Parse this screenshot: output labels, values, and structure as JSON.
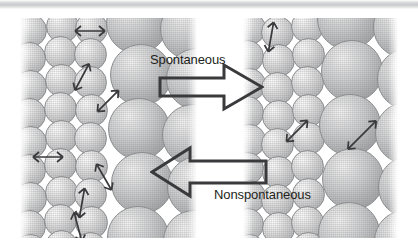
{
  "figure": {
    "title_text": "",
    "background_color": "#ffffff",
    "sphere_fill": "#d8d9da",
    "sphere_outline": "#8b8c8e",
    "arrow_color": "#3a3a3c",
    "text_color": "#231f20",
    "scan_band": true
  },
  "labels": {
    "spontaneous": "Spontaneous",
    "nonspontaneous": "Nonspontaneous"
  },
  "process_arrows": [
    {
      "name": "spontaneous-arrow",
      "direction": "right",
      "label": "Spontaneous"
    },
    {
      "name": "nonspontaneous-arrow",
      "direction": "left",
      "label": "Nonspontaneous"
    }
  ],
  "panels": {
    "left": {
      "name": "left-panel",
      "x": 20,
      "y": 18,
      "width": 177,
      "height": 220,
      "small_spheres": [
        {
          "x": -6,
          "y": -4,
          "d": 33
        },
        {
          "x": 26,
          "y": -8,
          "d": 33
        },
        {
          "x": 55,
          "y": -6,
          "d": 33
        },
        {
          "x": 24,
          "y": 18,
          "d": 33
        },
        {
          "x": -7,
          "y": 24,
          "d": 33
        },
        {
          "x": 54,
          "y": 20,
          "d": 33
        },
        {
          "x": -6,
          "y": 52,
          "d": 33
        },
        {
          "x": 25,
          "y": 46,
          "d": 33
        },
        {
          "x": 54,
          "y": 48,
          "d": 33
        },
        {
          "x": -7,
          "y": 80,
          "d": 33
        },
        {
          "x": 24,
          "y": 74,
          "d": 33
        },
        {
          "x": 55,
          "y": 76,
          "d": 33
        },
        {
          "x": -6,
          "y": 108,
          "d": 33
        },
        {
          "x": 25,
          "y": 102,
          "d": 33
        },
        {
          "x": 54,
          "y": 104,
          "d": 33
        },
        {
          "x": -7,
          "y": 136,
          "d": 33
        },
        {
          "x": 24,
          "y": 130,
          "d": 33
        },
        {
          "x": 55,
          "y": 132,
          "d": 33
        },
        {
          "x": -6,
          "y": 164,
          "d": 33
        },
        {
          "x": 25,
          "y": 158,
          "d": 33
        },
        {
          "x": 54,
          "y": 160,
          "d": 33
        },
        {
          "x": -7,
          "y": 192,
          "d": 33
        },
        {
          "x": 24,
          "y": 186,
          "d": 33
        },
        {
          "x": 55,
          "y": 188,
          "d": 33
        },
        {
          "x": 25,
          "y": 212,
          "d": 33
        },
        {
          "x": -6,
          "y": 216,
          "d": 33
        },
        {
          "x": 54,
          "y": 214,
          "d": 33
        }
      ],
      "large_spheres": [
        {
          "x": 86,
          "y": -26,
          "d": 62
        },
        {
          "x": 140,
          "y": -20,
          "d": 62
        },
        {
          "x": 90,
          "y": 26,
          "d": 62
        },
        {
          "x": 146,
          "y": 30,
          "d": 62
        },
        {
          "x": 88,
          "y": 80,
          "d": 62
        },
        {
          "x": 142,
          "y": 86,
          "d": 62
        },
        {
          "x": 91,
          "y": 134,
          "d": 62
        },
        {
          "x": 147,
          "y": 138,
          "d": 62
        },
        {
          "x": 87,
          "y": 188,
          "d": 62
        },
        {
          "x": 143,
          "y": 192,
          "d": 62
        }
      ],
      "vibration_arrows": [
        {
          "x": 48,
          "y": 4,
          "len": 30,
          "angle": 0
        },
        {
          "x": 40,
          "y": 50,
          "len": 30,
          "angle": 118
        },
        {
          "x": 66,
          "y": 74,
          "len": 30,
          "angle": 135
        },
        {
          "x": 6,
          "y": 130,
          "len": 30,
          "angle": 0
        },
        {
          "x": 40,
          "y": 176,
          "len": 30,
          "angle": 100
        },
        {
          "x": 62,
          "y": 150,
          "len": 30,
          "angle": 60
        },
        {
          "x": 36,
          "y": 200,
          "len": 30,
          "angle": 75
        }
      ]
    },
    "right": {
      "name": "right-panel",
      "x": 243,
      "y": 18,
      "width": 155,
      "height": 220,
      "small_spheres": [
        {
          "x": -10,
          "y": -6,
          "d": 33
        },
        {
          "x": 18,
          "y": -2,
          "d": 33
        },
        {
          "x": 48,
          "y": -8,
          "d": 33
        },
        {
          "x": -12,
          "y": 22,
          "d": 33
        },
        {
          "x": 19,
          "y": 26,
          "d": 33
        },
        {
          "x": 49,
          "y": 20,
          "d": 33
        },
        {
          "x": -10,
          "y": 50,
          "d": 33
        },
        {
          "x": 18,
          "y": 54,
          "d": 33
        },
        {
          "x": 48,
          "y": 48,
          "d": 33
        },
        {
          "x": -12,
          "y": 78,
          "d": 33
        },
        {
          "x": 19,
          "y": 82,
          "d": 33
        },
        {
          "x": 49,
          "y": 76,
          "d": 33
        },
        {
          "x": -10,
          "y": 106,
          "d": 33
        },
        {
          "x": 18,
          "y": 110,
          "d": 33
        },
        {
          "x": 49,
          "y": 104,
          "d": 33
        },
        {
          "x": -12,
          "y": 134,
          "d": 33
        },
        {
          "x": 19,
          "y": 138,
          "d": 33
        },
        {
          "x": 48,
          "y": 132,
          "d": 33
        },
        {
          "x": -10,
          "y": 162,
          "d": 33
        },
        {
          "x": 18,
          "y": 166,
          "d": 33
        },
        {
          "x": 49,
          "y": 160,
          "d": 33
        },
        {
          "x": -12,
          "y": 190,
          "d": 33
        },
        {
          "x": 19,
          "y": 194,
          "d": 33
        },
        {
          "x": 48,
          "y": 188,
          "d": 33
        },
        {
          "x": -10,
          "y": 216,
          "d": 33
        },
        {
          "x": 18,
          "y": 220,
          "d": 33
        },
        {
          "x": 49,
          "y": 214,
          "d": 33
        }
      ],
      "large_spheres": [
        {
          "x": 74,
          "y": -30,
          "d": 62
        },
        {
          "x": 130,
          "y": -22,
          "d": 62
        },
        {
          "x": 78,
          "y": 22,
          "d": 62
        },
        {
          "x": 134,
          "y": 30,
          "d": 62
        },
        {
          "x": 76,
          "y": 76,
          "d": 62
        },
        {
          "x": 132,
          "y": 84,
          "d": 62
        },
        {
          "x": 79,
          "y": 130,
          "d": 62
        },
        {
          "x": 135,
          "y": 138,
          "d": 62
        },
        {
          "x": 75,
          "y": 184,
          "d": 62
        },
        {
          "x": 131,
          "y": 192,
          "d": 62
        }
      ],
      "vibration_arrows": [
        {
          "x": 6,
          "y": 10,
          "len": 30,
          "angle": 100
        },
        {
          "x": 32,
          "y": 104,
          "len": 30,
          "angle": 135
        },
        {
          "x": 92,
          "y": 108,
          "len": 40,
          "angle": 135
        }
      ]
    }
  }
}
